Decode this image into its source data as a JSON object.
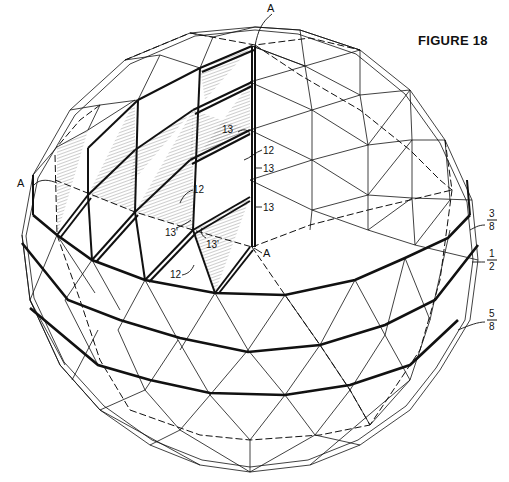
{
  "figure": {
    "title": "FIGURE 18"
  },
  "labels": {
    "section_marks": [
      "A",
      "A",
      "A"
    ],
    "part_numbers": [
      "13",
      "12",
      "13",
      "13",
      "12",
      "13'",
      "13'",
      "12"
    ],
    "fractions": [
      {
        "numerator": "3",
        "denominator": "8"
      },
      {
        "numerator": "1",
        "denominator": "2"
      },
      {
        "numerator": "5",
        "denominator": "8"
      }
    ]
  },
  "colors": {
    "ink": "#111111",
    "paper": "#ffffff"
  }
}
